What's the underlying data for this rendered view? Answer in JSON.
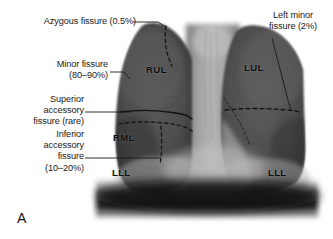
{
  "figure": {
    "panel_letter": "A",
    "modality": "chest-radiograph-illustration"
  },
  "annotations": [
    {
      "id": "azygous",
      "name": "azygous-fissure-label",
      "text": "Azygous fissure (0.5%)",
      "align": "right"
    },
    {
      "id": "minor",
      "name": "minor-fissure-label",
      "text": "Minor fissure\n(80–90%)",
      "align": "right"
    },
    {
      "id": "superior-accessory",
      "name": "superior-accessory-fissure-label",
      "text": "Superior\naccessory\nfissure (rare)",
      "align": "right"
    },
    {
      "id": "inferior-accessory",
      "name": "inferior-accessory-fissure-label",
      "text": "Inferior\naccessory\nfissure\n(10–20%)",
      "align": "right"
    },
    {
      "id": "left-minor",
      "name": "left-minor-fissure-label",
      "text": "Left minor\nfissure (2%)",
      "align": "center"
    }
  ],
  "lobe_labels": [
    {
      "id": "rul",
      "name": "lobe-label-rul",
      "text": "RUL"
    },
    {
      "id": "lul",
      "name": "lobe-label-lul",
      "text": "LUL"
    },
    {
      "id": "rml",
      "name": "lobe-label-rml",
      "text": "RML"
    },
    {
      "id": "rll",
      "name": "lobe-label-rll",
      "text": "LLL"
    },
    {
      "id": "lll",
      "name": "lobe-label-lll",
      "text": "LLL"
    }
  ],
  "colors": {
    "background": "#ffffff",
    "text": "#1a1a1a",
    "leader_line": "#1a1a1a",
    "fissure_line": "#111111",
    "lung_field": "#4a4a4a",
    "lung_field_light": "#5e5e5e",
    "mediastinum": "#9a9a9a",
    "mediastinum_bright": "#b4b4b4",
    "diaphragm_shadow": "#141414"
  }
}
